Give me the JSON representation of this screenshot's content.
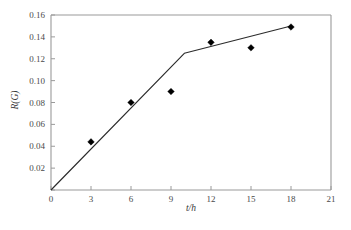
{
  "chart_data": {
    "type": "scatter",
    "title": "",
    "xlabel": "t/h",
    "ylabel": "R(G)",
    "xlim": [
      0,
      21
    ],
    "ylim": [
      0,
      0.16
    ],
    "grid": false,
    "legend": null,
    "x_ticks": [
      0,
      3,
      6,
      9,
      12,
      15,
      18,
      21
    ],
    "x_tick_labels": [
      "0",
      "3",
      "6",
      "9",
      "12",
      "15",
      "18",
      "21"
    ],
    "y_ticks": [
      0,
      0.02,
      0.04,
      0.06,
      0.08,
      0.1,
      0.12,
      0.14,
      0.16
    ],
    "y_tick_labels": [
      "",
      "0.02",
      "0.04",
      "0.06",
      "0.08",
      "0.10",
      "0.12",
      "0.14",
      "0.16"
    ],
    "series": [
      {
        "name": "measured",
        "type": "scatter",
        "marker": "diamond",
        "color": "#000000",
        "x": [
          3,
          6,
          9,
          12,
          15,
          18
        ],
        "y": [
          0.044,
          0.08,
          0.09,
          0.135,
          0.13,
          0.149
        ]
      },
      {
        "name": "fitted",
        "type": "line",
        "color": "#2b2b2b",
        "x": [
          0,
          10,
          18
        ],
        "y": [
          0.0,
          0.125,
          0.15
        ]
      }
    ]
  },
  "figure": {
    "axis_color": "#9a9a9a",
    "marker_color": "#000000",
    "line_color": "#2b2b2b",
    "background": "#ffffff",
    "x_axis_title": "t/h",
    "y_axis_title": "R(G)"
  }
}
